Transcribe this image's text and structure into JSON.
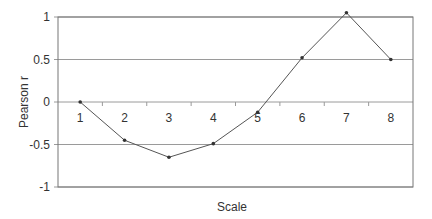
{
  "chart_data": {
    "type": "line",
    "title": "",
    "xlabel": "Scale",
    "ylabel": "Pearson r",
    "ylim": [
      -1,
      1
    ],
    "y_ticks": [
      1,
      0.5,
      0,
      -0.5,
      -1
    ],
    "y_tick_labels": [
      "1",
      "0.5",
      "0",
      "-0.5",
      "-1"
    ],
    "x": [
      1,
      2,
      3,
      4,
      5,
      6,
      7,
      8
    ],
    "x_tick_labels": [
      "1",
      "2",
      "3",
      "4",
      "5",
      "6",
      "7",
      "8"
    ],
    "grid": true,
    "legend": "none",
    "series": [
      {
        "name": "Pearson r",
        "values": [
          0.0,
          -0.45,
          -0.65,
          -0.49,
          -0.12,
          0.52,
          1.05,
          0.5
        ]
      }
    ],
    "colors": {
      "line": "#555555",
      "grid": "#9a9a9a",
      "frame": "#777777"
    }
  }
}
